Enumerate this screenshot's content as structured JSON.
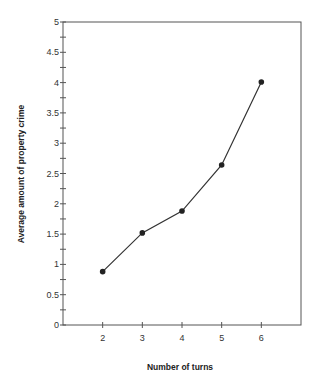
{
  "chart_data": {
    "type": "line",
    "title": "",
    "xlabel": "Number of turns",
    "ylabel": "Average amount of property crime",
    "x": [
      2,
      3,
      4,
      5,
      6
    ],
    "series": [
      {
        "name": "Average amount of property crime",
        "values": [
          0.88,
          1.52,
          1.88,
          2.64,
          4.01
        ],
        "marker": "circle"
      }
    ],
    "xlim": [
      1,
      7
    ],
    "ylim": [
      0,
      5
    ],
    "x_ticks": [
      "2",
      "3",
      "4",
      "5",
      "6"
    ],
    "y_ticks": [
      "0",
      "0.5",
      "1",
      "1.5",
      "2",
      "2.5",
      "3",
      "3.5",
      "4",
      "4.5",
      "5"
    ],
    "y_minor_step": 0.25,
    "grid": false,
    "legend": null,
    "frame": "box"
  },
  "colors": {
    "line": "#333333",
    "axis": "#555555",
    "background": "#ffffff"
  }
}
